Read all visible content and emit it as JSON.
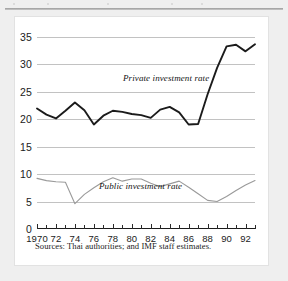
{
  "figure": {
    "background_color": "#efefef",
    "panel_color": "#ffffff",
    "caption_remnant": "",
    "sources_note": "Sources:  Thai authorities; and IMF staff estimates."
  },
  "chart_data": {
    "type": "line",
    "title": "",
    "subtitle": "",
    "xlabel": "",
    "ylabel": "",
    "xlim": [
      1970,
      1993
    ],
    "ylim": [
      0,
      36
    ],
    "grid": true,
    "legend_position": "inline-annotation",
    "yticks": [
      0,
      5,
      10,
      15,
      20,
      25,
      30,
      35
    ],
    "ytick_labels": [
      "0",
      "5",
      "10",
      "15",
      "20",
      "25",
      "30",
      "35"
    ],
    "x": [
      1970,
      1971,
      1972,
      1973,
      1974,
      1975,
      1976,
      1977,
      1978,
      1979,
      1980,
      1981,
      1982,
      1983,
      1984,
      1985,
      1986,
      1987,
      1988,
      1989,
      1990,
      1991,
      1992,
      1993
    ],
    "xticks": [
      1970,
      1971,
      1972,
      1973,
      1974,
      1975,
      1976,
      1977,
      1978,
      1979,
      1980,
      1981,
      1982,
      1983,
      1984,
      1985,
      1986,
      1987,
      1988,
      1989,
      1990,
      1991,
      1992,
      1993
    ],
    "xtick_labels": [
      "1970",
      "",
      "72",
      "",
      "74",
      "",
      "76",
      "",
      "78",
      "",
      "80",
      "",
      "82",
      "",
      "84",
      "",
      "86",
      "",
      "88",
      "",
      "90",
      "",
      "92",
      ""
    ],
    "xtick_major": [
      1970,
      1972,
      1974,
      1976,
      1978,
      1980,
      1982,
      1984,
      1986,
      1988,
      1990,
      1992
    ],
    "series": [
      {
        "name": "Private investment rate",
        "color": "#1b1b1b",
        "width": 1.9,
        "annotation": "Private investment rate",
        "values": [
          21.9,
          20.8,
          20.1,
          21.5,
          23.0,
          21.6,
          19.0,
          20.6,
          21.5,
          21.3,
          20.9,
          20.7,
          20.2,
          21.7,
          22.2,
          21.2,
          19.0,
          19.1,
          24.5,
          29.3,
          33.2,
          33.5,
          32.3,
          33.6
        ]
      },
      {
        "name": "Public investment rate",
        "color": "#9a9a9a",
        "width": 1.1,
        "annotation": "Public investment rate",
        "values": [
          9.2,
          8.8,
          8.6,
          8.5,
          4.6,
          6.3,
          7.5,
          8.6,
          9.3,
          8.7,
          9.1,
          9.1,
          8.3,
          7.7,
          8.2,
          8.7,
          7.6,
          6.4,
          5.2,
          5.0,
          5.9,
          7.0,
          8.0,
          8.8
        ]
      }
    ]
  }
}
